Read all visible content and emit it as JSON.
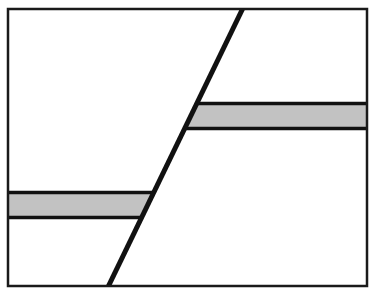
{
  "figure": {
    "type": "diagram",
    "canvas": {
      "width": 377,
      "height": 297
    },
    "background_color": "#ffffff",
    "frame": {
      "label": "outer rectangular frame",
      "x": 8,
      "y": 9,
      "width": 359,
      "height": 277,
      "stroke_color": "#1a1a1a",
      "stroke_width": 2.5,
      "fill_color": "#ffffff"
    },
    "fault_line": {
      "label": "inclined fault line",
      "x1": 108,
      "y1": 286,
      "x2": 243,
      "y2": 9,
      "stroke_color": "#111111",
      "stroke_width": 5
    },
    "strata": [
      {
        "label": "upper gray bed (hanging-wall side, right of fault)",
        "side": "right",
        "top": 103,
        "bottom": 128,
        "left_edge": "fault",
        "right_edge": "frame",
        "fill_color": "#c2c2c2",
        "stroke_color": "#111111",
        "stroke_width": 3.5
      },
      {
        "label": "lower gray bed (footwall side, left of fault)",
        "side": "left",
        "top": 192,
        "bottom": 217,
        "left_edge": "frame",
        "right_edge": "fault",
        "fill_color": "#c2c2c2",
        "stroke_color": "#111111",
        "stroke_width": 3.5
      }
    ],
    "colors": {
      "ink": "#111111",
      "bed_gray": "#c2c2c2",
      "paper": "#ffffff"
    }
  }
}
